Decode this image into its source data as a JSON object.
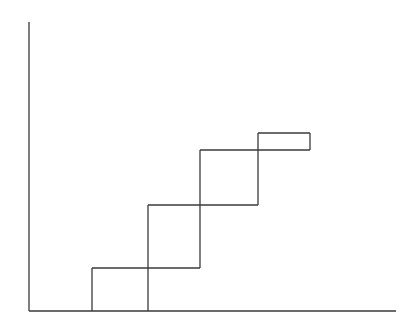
{
  "diagram": {
    "type": "step-staircase",
    "stroke_color": "#3a3a3a",
    "background": "#ffffff",
    "axes": {
      "y_axis": {
        "x": 29,
        "y1": 22,
        "y2": 311
      },
      "x_axis": {
        "y": 311,
        "x1": 29,
        "x2": 396
      }
    },
    "segments": [
      {
        "name": "vertical-1",
        "x1": 92,
        "y1": 268,
        "x2": 92,
        "y2": 311
      },
      {
        "name": "horizontal-1",
        "x1": 92,
        "y1": 268,
        "x2": 200,
        "y2": 268
      },
      {
        "name": "vertical-2",
        "x1": 148,
        "y1": 205,
        "x2": 148,
        "y2": 311
      },
      {
        "name": "horizontal-2",
        "x1": 148,
        "y1": 205,
        "x2": 258,
        "y2": 205
      },
      {
        "name": "vertical-3",
        "x1": 200,
        "y1": 150,
        "x2": 200,
        "y2": 268
      },
      {
        "name": "horizontal-3",
        "x1": 200,
        "y1": 150,
        "x2": 310,
        "y2": 150
      },
      {
        "name": "vertical-4",
        "x1": 258,
        "y1": 133,
        "x2": 258,
        "y2": 205
      },
      {
        "name": "horizontal-4",
        "x1": 258,
        "y1": 133,
        "x2": 310,
        "y2": 133
      },
      {
        "name": "vertical-5",
        "x1": 310,
        "y1": 133,
        "x2": 310,
        "y2": 150
      }
    ]
  }
}
